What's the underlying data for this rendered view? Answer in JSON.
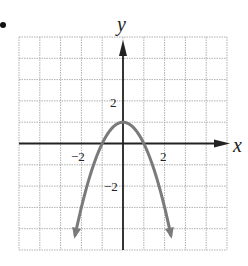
{
  "chart_data": {
    "type": "line",
    "title": "",
    "xlabel": "x",
    "ylabel": "y",
    "xlim": [
      -5,
      5
    ],
    "ylim": [
      -5,
      5
    ],
    "grid": true,
    "tick_labels": {
      "x": [
        {
          "value": -2,
          "label": "−2"
        },
        {
          "value": 2,
          "label": "2"
        }
      ],
      "y": [
        {
          "value": 2,
          "label": "2"
        },
        {
          "value": -2,
          "label": "−2"
        }
      ]
    },
    "series": [
      {
        "name": "parabola",
        "equation": "y = 1 - x^2",
        "color": "#7a7a7a",
        "vertex": [
          0,
          1
        ],
        "x_intercepts": [
          -1,
          1
        ],
        "arrows_at_ends": true,
        "x_range": [
          -2.3,
          2.3
        ]
      }
    ]
  },
  "colors": {
    "grid": "#b0b0b0",
    "axis": "#222222",
    "curve": "#7a7a7a"
  }
}
